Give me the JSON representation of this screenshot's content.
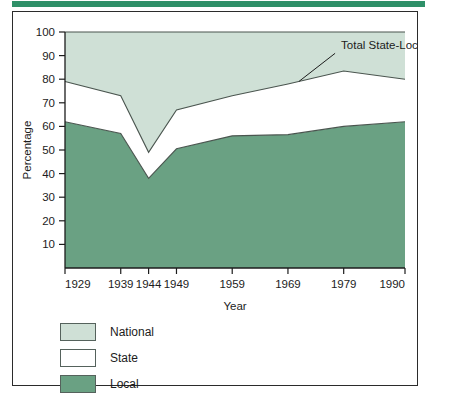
{
  "figure": {
    "accent_bar_color": "#2f9068",
    "frame_border_color": "#2b2b2b"
  },
  "chart_data": {
    "type": "area",
    "stacked": true,
    "title": "",
    "xlabel": "Year",
    "ylabel": "Percentage",
    "categories": [
      "1929",
      "1939",
      "1944",
      "1949",
      "1959",
      "1969",
      "1979",
      "1990"
    ],
    "x": [
      1929,
      1939,
      1944,
      1949,
      1959,
      1969,
      1979,
      1990
    ],
    "xlim": [
      1929,
      1990
    ],
    "ylim": [
      0,
      100
    ],
    "yticks": [
      10,
      20,
      30,
      40,
      50,
      60,
      70,
      80,
      90,
      100
    ],
    "xticks": [
      1929,
      1939,
      1944,
      1949,
      1959,
      1969,
      1979,
      1990
    ],
    "grid": false,
    "legend_position": "below-left",
    "series": [
      {
        "name": "Local",
        "color": "#6aa183",
        "values": [
          62,
          57,
          38,
          50.5,
          56,
          56.5,
          60,
          62
        ],
        "cumulative": [
          62,
          57,
          38,
          50.5,
          56,
          56.5,
          60,
          62
        ]
      },
      {
        "name": "State",
        "color": "#ffffff",
        "values": [
          17,
          16,
          11,
          16.5,
          17,
          21.5,
          23.5,
          18
        ],
        "cumulative": [
          79,
          73,
          49,
          67,
          73,
          78,
          83.5,
          80
        ]
      },
      {
        "name": "National",
        "color": "#cfe0d6",
        "values": [
          21,
          27,
          51,
          33,
          27,
          22,
          16.5,
          20
        ],
        "cumulative": [
          100,
          100,
          100,
          100,
          100,
          100,
          100,
          100
        ]
      }
    ],
    "annotations": [
      {
        "text": "Total State-Local",
        "points_to_series": "State",
        "points_to_x": 1971
      }
    ]
  },
  "legend": {
    "items": [
      {
        "label": "National",
        "color": "#cfe0d6"
      },
      {
        "label": "State",
        "color": "#ffffff"
      },
      {
        "label": "Local",
        "color": "#6aa183"
      }
    ]
  }
}
